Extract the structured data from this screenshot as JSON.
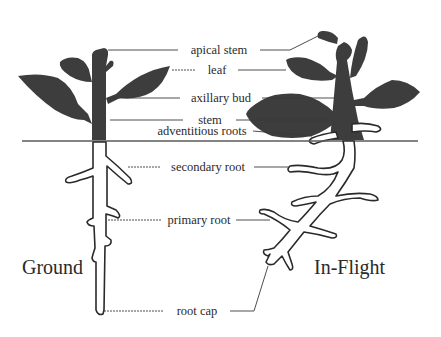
{
  "diagram": {
    "labels": {
      "apical_stem": "apical stem",
      "leaf": "leaf",
      "axillary_bud": "axillary bud",
      "stem": "stem",
      "adventitious_roots": "adventitious roots",
      "secondary_root": "secondary root",
      "primary_root": "primary root",
      "root_cap": "root cap"
    },
    "panels": {
      "left": "Ground",
      "right": "In-Flight"
    },
    "colors": {
      "plant_fill": "#3d3d3d",
      "outline": "#2a2a2a",
      "ground_line": "#5a5a5a",
      "background": "#ffffff"
    }
  }
}
